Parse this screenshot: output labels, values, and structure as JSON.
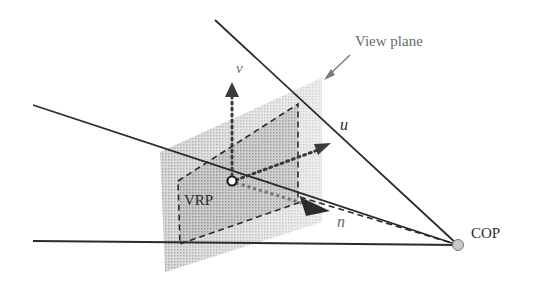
{
  "diagram": {
    "labels": {
      "view_plane": "View plane",
      "v_axis": "v",
      "u_axis": "u",
      "n_axis": "n",
      "vrp": "VRP",
      "cop": "COP"
    },
    "colors": {
      "background": "#ffffff",
      "line": "#2b2b2b",
      "plane_fill": "#bdbdbd",
      "plane_inner_fill": "#a8a8a8",
      "label_gray": "#6a6a6a",
      "cop_fill": "#c8c8c8"
    },
    "nodes": [
      {
        "id": "vrp",
        "label": "VRP",
        "x": 232,
        "y": 181
      },
      {
        "id": "cop",
        "label": "COP",
        "x": 458,
        "y": 245
      }
    ],
    "edges": [
      {
        "from": "top-left",
        "to": "cop",
        "style": "solid"
      },
      {
        "from": "mid-left",
        "to": "cop",
        "style": "solid"
      },
      {
        "from": "bottom-left",
        "to": "cop",
        "style": "solid"
      },
      {
        "from": "plane",
        "to": "cop",
        "style": "dashed"
      },
      {
        "from": "vrp",
        "to": "v",
        "style": "dotted-arrow"
      },
      {
        "from": "vrp",
        "to": "u",
        "style": "dotted-arrow"
      },
      {
        "from": "vrp",
        "to": "n",
        "style": "solid-arrow"
      },
      {
        "from": "view-plane-label",
        "to": "plane",
        "style": "arrow"
      }
    ]
  }
}
